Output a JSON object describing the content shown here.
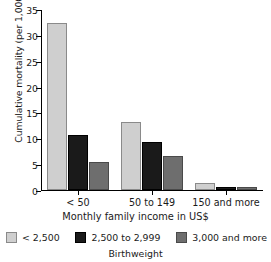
{
  "chart_data": {
    "type": "bar",
    "title": "",
    "xlabel": "Monthly family income in US$",
    "ylabel": "Cumulative mortality (per 1,000)",
    "categories": [
      "< 50",
      "50 to 149",
      "150 and more"
    ],
    "series": [
      {
        "name": "< 2,500",
        "color": "#cfcfcf",
        "values": [
          32.3,
          13.1,
          1.4
        ]
      },
      {
        "name": "2,500 to 2,999",
        "color": "#1a1a1a",
        "values": [
          10.7,
          9.3,
          0.6
        ]
      },
      {
        "name": "3,000 and more",
        "color": "#6e6e6e",
        "values": [
          5.4,
          6.5,
          0.6
        ]
      }
    ],
    "ylim": [
      0,
      35
    ],
    "yticks": [
      0,
      5,
      10,
      15,
      20,
      25,
      30,
      35
    ],
    "ytick_labels": [
      "0",
      "5",
      "10",
      "15",
      "20",
      "25",
      "30",
      "35"
    ],
    "grid": false,
    "legend_position": "bottom",
    "legend_title": "Birthweight"
  }
}
